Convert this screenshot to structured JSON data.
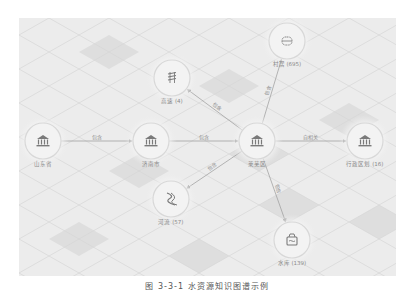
{
  "figure": {
    "caption": "图 3-3-1  水资源知识图谱示例",
    "background": {
      "base": "#ececec",
      "grid_line": "#d6d6d6",
      "dark_tile": "#dedede"
    },
    "node_style": {
      "fill": "#f3f3f3",
      "stroke": "#d8d8d8",
      "icon_color": "#7a7a7a",
      "label_color": "#8a8a8a"
    },
    "edge_style": {
      "color": "#9a9a9a",
      "label_color": "#8f8f8f"
    }
  },
  "nodes": [
    {
      "id": "shandong",
      "label": "山东省",
      "icon": "government-building-icon",
      "x": 24,
      "y": 123
    },
    {
      "id": "jinan",
      "label": "济南市",
      "icon": "government-building-icon",
      "x": 132,
      "y": 123
    },
    {
      "id": "laiwu",
      "label": "莱芜区",
      "icon": "government-building-icon",
      "x": 238,
      "y": 123
    },
    {
      "id": "xingzheng",
      "label": "行政区划 (16)",
      "icon": "government-building-icon",
      "x": 346,
      "y": 123
    },
    {
      "id": "cunju",
      "label": "村居 (695)",
      "icon": "village-icon",
      "x": 268,
      "y": 23
    },
    {
      "id": "gaosu",
      "label": "高速 (4)",
      "icon": "highway-icon",
      "x": 153,
      "y": 60
    },
    {
      "id": "heliu",
      "label": "河流 (57)",
      "icon": "river-icon",
      "x": 152,
      "y": 181
    },
    {
      "id": "shuiku",
      "label": "水库 (139)",
      "icon": "reservoir-icon",
      "x": 273,
      "y": 222
    }
  ],
  "edges": [
    {
      "from": "shandong",
      "to": "jinan",
      "label": "包含"
    },
    {
      "from": "jinan",
      "to": "laiwu",
      "label": "包含"
    },
    {
      "from": "laiwu",
      "to": "xingzheng",
      "label": "自相关"
    },
    {
      "from": "laiwu",
      "to": "cunju",
      "label": "包含"
    },
    {
      "from": "laiwu",
      "to": "gaosu",
      "label": "包含"
    },
    {
      "from": "laiwu",
      "to": "heliu",
      "label": "包含"
    },
    {
      "from": "laiwu",
      "to": "shuiku",
      "label": "包含"
    }
  ]
}
